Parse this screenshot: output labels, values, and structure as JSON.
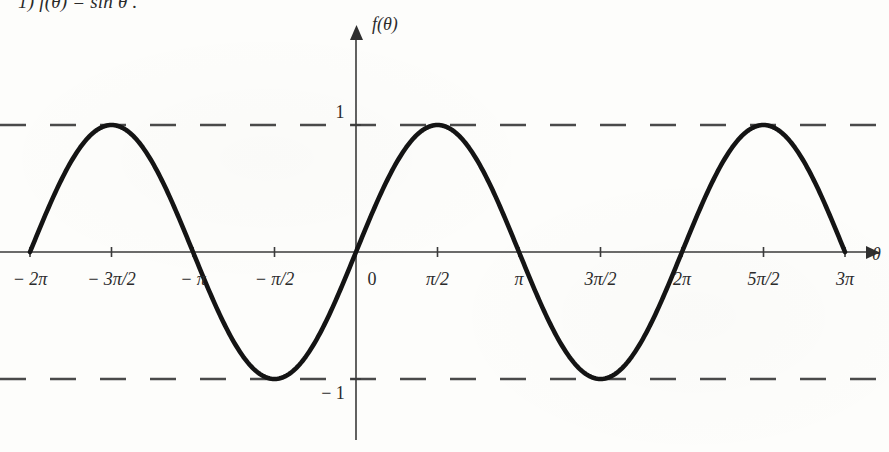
{
  "problem": {
    "number": "1)",
    "statement": "f(θ) = sin θ ."
  },
  "chart_data": {
    "type": "line",
    "title": "",
    "xlabel": "θ",
    "ylabel": "f(θ)",
    "function": "f(θ) = sin θ",
    "xlim": [
      -6.283185307,
      9.424777961
    ],
    "ylim": [
      -1.45,
      1.45
    ],
    "grid": false,
    "legend": null,
    "x_tick_labels": [
      "− 2π",
      "− 3π/2",
      "− π",
      "− π/2",
      "0",
      "π/2",
      "π",
      "3π/2",
      "2π",
      "5π/2",
      "3π"
    ],
    "x_tick_values": [
      -6.283185307,
      -4.71238898,
      -3.141592654,
      -1.570796327,
      0,
      1.570796327,
      3.141592654,
      4.71238898,
      6.283185307,
      7.853981634,
      9.424777961
    ],
    "y_tick_labels": [
      "1",
      "− 1"
    ],
    "y_tick_values": [
      1,
      -1
    ],
    "asymptote_lines": [
      {
        "y": 1,
        "style": "dashed"
      },
      {
        "y": -1,
        "style": "dashed"
      }
    ],
    "series": [
      {
        "name": "sin θ",
        "color": "#141414",
        "amplitude": 1,
        "period": 6.283185307,
        "phase": 0,
        "x_start": -6.283185307,
        "x_end": 9.424777961,
        "key_points": [
          {
            "x": -6.283185307,
            "y": 0,
            "label": "− 2π"
          },
          {
            "x": -4.71238898,
            "y": 1,
            "label": "max at − 3π/2"
          },
          {
            "x": -3.141592654,
            "y": 0,
            "label": "− π"
          },
          {
            "x": -1.570796327,
            "y": -1,
            "label": "min at − π/2"
          },
          {
            "x": 0,
            "y": 0,
            "label": "0"
          },
          {
            "x": 1.570796327,
            "y": 1,
            "label": "max at π/2"
          },
          {
            "x": 3.141592654,
            "y": 0,
            "label": "π"
          },
          {
            "x": 4.71238898,
            "y": -1,
            "label": "min at 3π/2"
          },
          {
            "x": 6.283185307,
            "y": 0,
            "label": "2π"
          },
          {
            "x": 7.853981634,
            "y": 1,
            "label": "max at 5π/2"
          },
          {
            "x": 9.424777961,
            "y": 0,
            "label": "3π"
          }
        ]
      }
    ]
  },
  "axes": {
    "x_axis_name": "θ",
    "y_axis_name": "f(θ)"
  },
  "colors": {
    "curve": "#141414",
    "axis": "#3a3a3a",
    "dashed": "#4a4a4a",
    "text": "#2b2b2b",
    "background": "#fdfdfb"
  }
}
